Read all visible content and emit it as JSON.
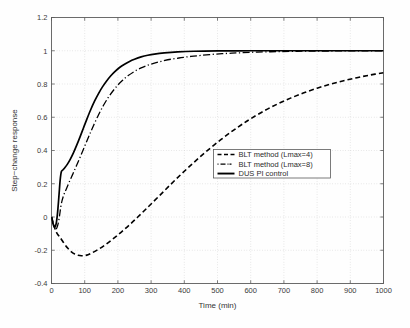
{
  "chart_data": {
    "type": "line",
    "title": "",
    "xlabel": "Time (min)",
    "ylabel": "Step−change response",
    "xlim": [
      0,
      1000
    ],
    "ylim": [
      -0.4,
      1.2
    ],
    "xticks": [
      0,
      100,
      200,
      300,
      400,
      500,
      600,
      700,
      800,
      900,
      1000
    ],
    "xticklabels": [
      "0",
      "100",
      "200",
      "300",
      "400",
      "500",
      "600",
      "700",
      "800",
      "900",
      "1000"
    ],
    "yticks": [
      -0.4,
      -0.2,
      0,
      0.2,
      0.4,
      0.6,
      0.8,
      1,
      1.2
    ],
    "yticklabels": [
      "-0.4",
      "-0.2",
      "0",
      "0.2",
      "0.4",
      "0.6",
      "0.8",
      "1",
      "1.2"
    ],
    "grid": true,
    "grid_style": "dotted",
    "grid_color": "#c9c9c9",
    "legend_position": "center-right",
    "series": [
      {
        "name": "BLT method (Lmax=4)",
        "style": "dashed",
        "color": "#000000",
        "width": 1.6,
        "dasharray": "5 3",
        "x": [
          0,
          5,
          10,
          15,
          20,
          25,
          30,
          40,
          50,
          60,
          70,
          80,
          90,
          100,
          110,
          120,
          140,
          160,
          180,
          200,
          220,
          240,
          260,
          280,
          300,
          330,
          360,
          390,
          420,
          450,
          480,
          510,
          540,
          570,
          600,
          640,
          680,
          720,
          760,
          800,
          840,
          880,
          920,
          960,
          1000
        ],
        "y": [
          0,
          -0.035,
          -0.068,
          -0.092,
          -0.108,
          -0.12,
          -0.135,
          -0.165,
          -0.19,
          -0.21,
          -0.223,
          -0.23,
          -0.233,
          -0.232,
          -0.227,
          -0.218,
          -0.196,
          -0.17,
          -0.14,
          -0.108,
          -0.074,
          -0.038,
          0.0,
          0.039,
          0.078,
          0.138,
          0.198,
          0.256,
          0.312,
          0.366,
          0.417,
          0.465,
          0.51,
          0.552,
          0.591,
          0.638,
          0.679,
          0.715,
          0.747,
          0.775,
          0.799,
          0.82,
          0.838,
          0.854,
          0.868
        ]
      },
      {
        "name": "BLT method (Lmax=8)",
        "style": "dash-dot",
        "color": "#000000",
        "width": 1.3,
        "dasharray": "7 2.5 1.2 2.5",
        "x": [
          0,
          4,
          8,
          12,
          16,
          20,
          24,
          28,
          32,
          38,
          45,
          55,
          65,
          75,
          85,
          95,
          105,
          115,
          125,
          140,
          155,
          170,
          185,
          200,
          215,
          230,
          250,
          270,
          290,
          310,
          330,
          360,
          390,
          420,
          450,
          490,
          530,
          570,
          620,
          680,
          740,
          800,
          870,
          940,
          1000
        ],
        "y": [
          0,
          -0.03,
          -0.058,
          -0.072,
          -0.066,
          -0.04,
          0.005,
          0.06,
          0.1,
          0.138,
          0.17,
          0.218,
          0.262,
          0.308,
          0.354,
          0.402,
          0.45,
          0.497,
          0.543,
          0.608,
          0.666,
          0.716,
          0.758,
          0.794,
          0.824,
          0.849,
          0.876,
          0.897,
          0.913,
          0.926,
          0.936,
          0.949,
          0.958,
          0.966,
          0.972,
          0.979,
          0.984,
          0.988,
          0.992,
          0.995,
          0.997,
          0.998,
          0.999,
          1.0,
          1.0
        ]
      },
      {
        "name": "DUS PI control",
        "style": "solid",
        "color": "#000000",
        "width": 1.7,
        "dasharray": "",
        "x": [
          0,
          3,
          6,
          9,
          12,
          15,
          18,
          21,
          24,
          26,
          28,
          30,
          34,
          40,
          48,
          56,
          66,
          76,
          86,
          96,
          106,
          118,
          130,
          142,
          154,
          166,
          178,
          190,
          205,
          220,
          235,
          250,
          270,
          290,
          310,
          340,
          380,
          430,
          500,
          600,
          700,
          800,
          900,
          1000
        ],
        "y": [
          0,
          -0.028,
          -0.05,
          -0.06,
          -0.055,
          -0.03,
          0.02,
          0.09,
          0.17,
          0.22,
          0.255,
          0.274,
          0.283,
          0.296,
          0.318,
          0.345,
          0.386,
          0.432,
          0.482,
          0.534,
          0.586,
          0.645,
          0.698,
          0.744,
          0.784,
          0.818,
          0.848,
          0.873,
          0.899,
          0.919,
          0.936,
          0.949,
          0.963,
          0.973,
          0.98,
          0.987,
          0.993,
          0.997,
          0.999,
          1.0,
          1.0,
          1.0,
          1.0,
          1.0
        ]
      }
    ],
    "legend": [
      {
        "label": "BLT method (Lmax=4)",
        "style": "dashed",
        "dasharray": "4 2.5",
        "width": 1.6
      },
      {
        "label": "BLT method (Lmax=8)",
        "style": "dash-dot",
        "dasharray": "1 2 5 2 1",
        "width": 1.3
      },
      {
        "label": "DUS PI control",
        "style": "solid",
        "dasharray": "",
        "width": 1.9
      }
    ]
  },
  "axes": {
    "x_title": "Time (min)",
    "y_title": "Step−change response"
  }
}
